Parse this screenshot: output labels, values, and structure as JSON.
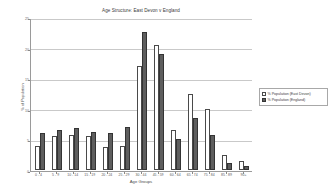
{
  "chart_data": {
    "type": "bar",
    "title": "Age Structure: East Devon v England",
    "xlabel": "Age Groups",
    "ylabel": "% of Population",
    "categories": [
      "0 - 4",
      "5 - 9",
      "10 - 14",
      "15 - 19",
      "20 - 24",
      "25 - 29",
      "30 - 44",
      "45 - 59",
      "60 - 64",
      "65 - 74",
      "75 - 84",
      "85 - 89",
      "90+"
    ],
    "series": [
      {
        "name": "% Population (East Devon)",
        "color": "#ffffff",
        "values": [
          4.0,
          5.5,
          5.8,
          5.6,
          3.8,
          4.0,
          17.0,
          20.5,
          6.5,
          12.5,
          10.0,
          2.5,
          1.5
        ]
      },
      {
        "name": "% Population (England)",
        "color": "#5e5e5e",
        "values": [
          6.0,
          6.5,
          6.8,
          6.2,
          6.0,
          7.0,
          22.5,
          19.0,
          5.0,
          8.5,
          5.8,
          1.2,
          0.7
        ]
      }
    ],
    "ylim": [
      0,
      25
    ],
    "yticks": [
      0,
      5,
      10,
      15,
      20,
      25
    ],
    "ytick_labels": [
      "0",
      "5",
      "10",
      "15",
      "20",
      "25"
    ],
    "grid": true,
    "legend_position": "right"
  },
  "legend": {
    "entries": [
      {
        "label": "% Population (East Devon)"
      },
      {
        "label": "% Population (England)"
      }
    ]
  }
}
